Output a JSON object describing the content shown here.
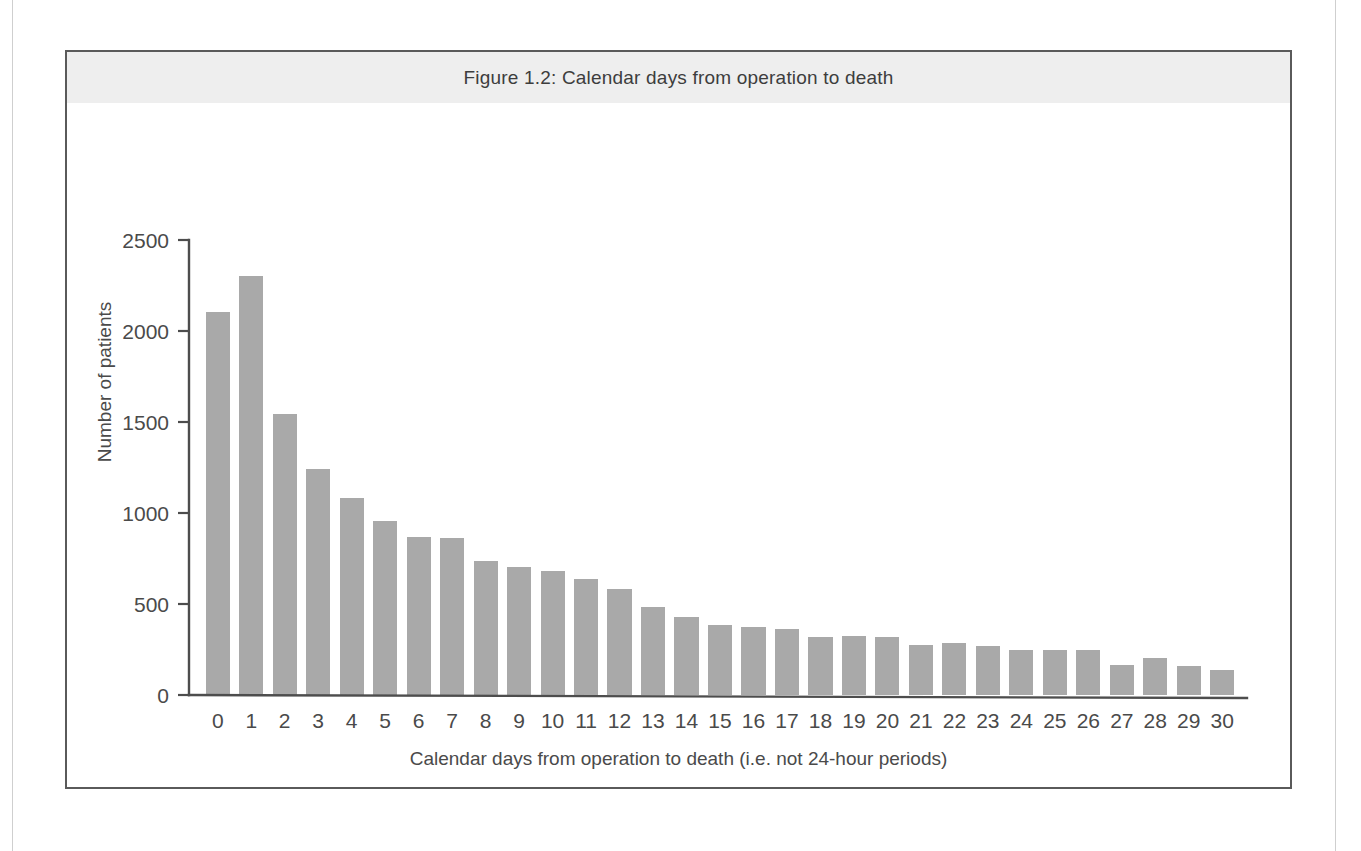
{
  "figure": {
    "title": "Figure 1.2: Calendar days from operation to death",
    "border_color": "#5a5a5a",
    "header_bg": "#eeeeee"
  },
  "chart_data": {
    "type": "bar",
    "title": "Figure 1.2: Calendar days from operation to death",
    "xlabel": "Calendar days from operation to death (i.e. not 24-hour periods)",
    "ylabel": "Number of patients",
    "categories": [
      "0",
      "1",
      "2",
      "3",
      "4",
      "5",
      "6",
      "7",
      "8",
      "9",
      "10",
      "11",
      "12",
      "13",
      "14",
      "15",
      "16",
      "17",
      "18",
      "19",
      "20",
      "21",
      "22",
      "23",
      "24",
      "25",
      "26",
      "27",
      "28",
      "29",
      "30"
    ],
    "values": [
      2105,
      2300,
      1545,
      1240,
      1085,
      955,
      870,
      860,
      735,
      705,
      680,
      640,
      580,
      485,
      430,
      385,
      375,
      360,
      320,
      325,
      320,
      275,
      285,
      270,
      250,
      248,
      245,
      165,
      205,
      160,
      140
    ],
    "ylim": [
      0,
      2500
    ],
    "yticks": [
      0,
      500,
      1000,
      1500,
      2000,
      2500
    ],
    "ytick_labels": [
      "0",
      "500",
      "1000",
      "1500",
      "2000",
      "2500"
    ],
    "grid": false,
    "legend": null,
    "bar_color": "#a9a9a9",
    "axis_color": "#4d4d4d"
  }
}
